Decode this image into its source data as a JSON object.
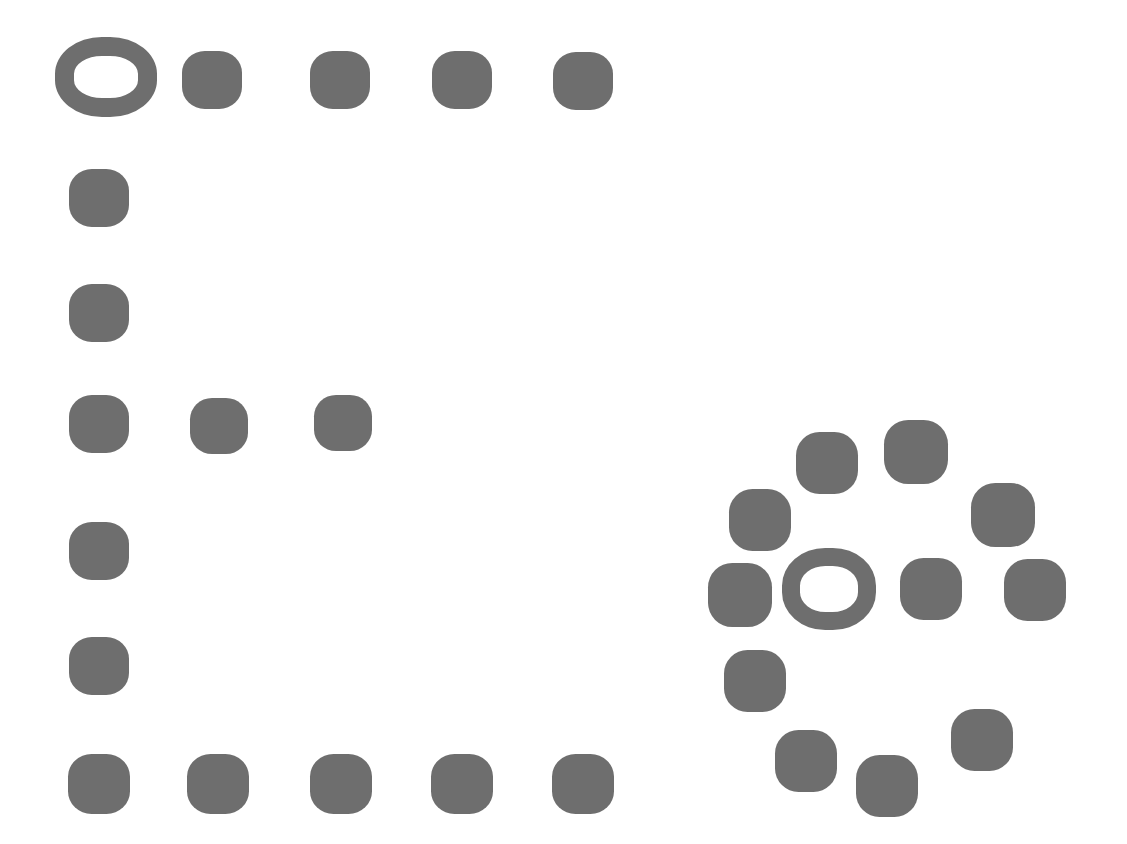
{
  "figure": {
    "canvas": {
      "width": 1127,
      "height": 844
    },
    "background_color": "#ffffff",
    "dot_color": "#6e6e6e",
    "ring_color": "#6e6e6e",
    "dot_shape": "rounded-square",
    "ring_shape": "rounded-square-annulus",
    "total_dots": 27,
    "total_rings": 2
  },
  "chart_data": {
    "type": "scatter",
    "xlabel": "",
    "ylabel": "",
    "xlim": [
      0,
      1127
    ],
    "ylim": [
      0,
      844
    ],
    "grid": false,
    "legend": "none",
    "units": "pixels",
    "marker_styles": {
      "dot": {
        "shape": "rounded-square",
        "fill": "#6e6e6e",
        "size": 59
      },
      "ring": {
        "shape": "rounded-square-ring",
        "stroke": "#6e6e6e",
        "fill": "none",
        "size": 101,
        "stroke_width": 19
      }
    },
    "series": [
      {
        "name": "left-grid-dots",
        "marker": "dot",
        "count": 14,
        "points": [
          {
            "cx": 212,
            "cy": 80,
            "w": 60,
            "h": 58,
            "label": "top-row-1"
          },
          {
            "cx": 340,
            "cy": 80,
            "w": 60,
            "h": 58,
            "label": "top-row-2"
          },
          {
            "cx": 462,
            "cy": 80,
            "w": 60,
            "h": 58,
            "label": "top-row-3"
          },
          {
            "cx": 583,
            "cy": 81,
            "w": 60,
            "h": 58,
            "label": "top-row-4"
          },
          {
            "cx": 99,
            "cy": 198,
            "w": 60,
            "h": 58,
            "label": "left-col-1"
          },
          {
            "cx": 99,
            "cy": 313,
            "w": 60,
            "h": 58,
            "label": "left-col-2"
          },
          {
            "cx": 99,
            "cy": 424,
            "w": 60,
            "h": 58,
            "label": "mid-row-1"
          },
          {
            "cx": 219,
            "cy": 426,
            "w": 58,
            "h": 56,
            "label": "mid-row-2"
          },
          {
            "cx": 343,
            "cy": 423,
            "w": 58,
            "h": 56,
            "label": "mid-row-3"
          },
          {
            "cx": 99,
            "cy": 551,
            "w": 60,
            "h": 58,
            "label": "left-col-3"
          },
          {
            "cx": 99,
            "cy": 666,
            "w": 60,
            "h": 58,
            "label": "left-col-4"
          },
          {
            "cx": 99,
            "cy": 784,
            "w": 62,
            "h": 60,
            "label": "bottom-row-1"
          },
          {
            "cx": 218,
            "cy": 784,
            "w": 62,
            "h": 60,
            "label": "bottom-row-2"
          },
          {
            "cx": 341,
            "cy": 784,
            "w": 62,
            "h": 60,
            "label": "bottom-row-3"
          }
        ]
      },
      {
        "name": "left-grid-dots-extra",
        "marker": "dot",
        "count": 2,
        "points": [
          {
            "cx": 462,
            "cy": 784,
            "w": 62,
            "h": 60,
            "label": "bottom-row-4"
          },
          {
            "cx": 583,
            "cy": 784,
            "w": 62,
            "h": 60,
            "label": "bottom-row-5"
          }
        ]
      },
      {
        "name": "right-cluster-dots",
        "marker": "dot",
        "count": 12,
        "points": [
          {
            "cx": 827,
            "cy": 463,
            "w": 62,
            "h": 62,
            "label": "cluster-n-left"
          },
          {
            "cx": 916,
            "cy": 452,
            "w": 64,
            "h": 64,
            "label": "cluster-n-right"
          },
          {
            "cx": 760,
            "cy": 520,
            "w": 62,
            "h": 62,
            "label": "cluster-nw"
          },
          {
            "cx": 1003,
            "cy": 515,
            "w": 64,
            "h": 64,
            "label": "cluster-ne"
          },
          {
            "cx": 740,
            "cy": 595,
            "w": 64,
            "h": 64,
            "label": "cluster-w"
          },
          {
            "cx": 931,
            "cy": 589,
            "w": 62,
            "h": 62,
            "label": "cluster-e-inner"
          },
          {
            "cx": 1035,
            "cy": 590,
            "w": 62,
            "h": 62,
            "label": "cluster-e-outer"
          },
          {
            "cx": 755,
            "cy": 681,
            "w": 62,
            "h": 62,
            "label": "cluster-sw"
          },
          {
            "cx": 806,
            "cy": 761,
            "w": 62,
            "h": 62,
            "label": "cluster-s-left"
          },
          {
            "cx": 887,
            "cy": 786,
            "w": 62,
            "h": 62,
            "label": "cluster-s-mid"
          },
          {
            "cx": 982,
            "cy": 740,
            "w": 62,
            "h": 62,
            "label": "cluster-se"
          },
          {
            "cx": 1035,
            "cy": 590,
            "w": 0,
            "h": 0,
            "label": "duplicate-placeholder"
          }
        ]
      },
      {
        "name": "rings",
        "marker": "ring",
        "count": 2,
        "points": [
          {
            "cx": 106,
            "cy": 77,
            "w": 102,
            "h": 80,
            "stroke_width": 19,
            "label": "left-corner-ring"
          },
          {
            "cx": 829,
            "cy": 589,
            "w": 94,
            "h": 82,
            "stroke_width": 18,
            "label": "cluster-center-ring"
          }
        ]
      }
    ]
  }
}
